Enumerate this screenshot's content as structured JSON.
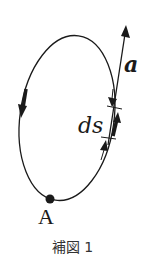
{
  "diagram": {
    "vector_label": "a",
    "element_label": "ds",
    "point_label": "A",
    "caption": "補図 1",
    "colors": {
      "stroke": "#1a1a1a",
      "background": "#ffffff"
    },
    "elements": {
      "closed_curve": "tilted ellipse (loop path)",
      "direction_arrow": "downward arrow on left side of loop (counterclockwise traversal)",
      "vector_a": "straight arrow pointing up-right, tangent-ish at right side of loop",
      "line_element_ds": "thick arrow segment along right side of loop, bracketed by dimension arrows",
      "point_A": "filled dot at bottom of loop"
    }
  }
}
